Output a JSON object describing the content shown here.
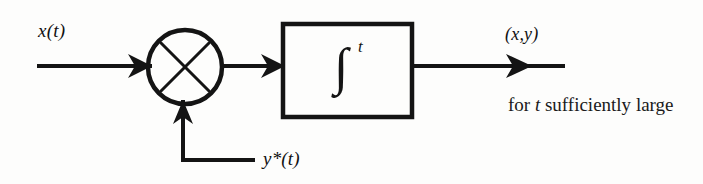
{
  "figure": {
    "type": "block-diagram",
    "background_color": "#fdfdfc",
    "ink_color": "#111111"
  },
  "labels": {
    "input_signal": "x(t)",
    "feedback_signal": "y*(t)",
    "output_signal": "(x,y)",
    "caption_line1_prefix": "for ",
    "caption_line1_italic": "t",
    "caption_line1_suffix": " sufficiently",
    "caption_line2": "large"
  },
  "blocks": [
    {
      "name": "multiplier",
      "shape": "circle",
      "symbol": "×",
      "cx": 185,
      "cy": 67,
      "r": 37
    },
    {
      "name": "integrator",
      "shape": "rectangle",
      "symbol": "∫",
      "superscript": "t",
      "x": 283,
      "y": 24,
      "width": 129,
      "height": 93
    }
  ],
  "connections": [
    {
      "name": "input-line",
      "from": "x(t) source",
      "to": "multiplier",
      "points": "37,66 148,66",
      "arrow": true
    },
    {
      "name": "multiplier-to-integrator",
      "from": "multiplier",
      "to": "integrator",
      "points": "222,66 283,66",
      "arrow": true
    },
    {
      "name": "integrator-output",
      "from": "integrator",
      "to": "(x,y) output",
      "points": "412,66 565,66",
      "arrow": true
    },
    {
      "name": "feedback-line",
      "from": "y*(t) source",
      "to": "multiplier",
      "points": "255,160 183,160 183,104",
      "arrow": true
    }
  ]
}
